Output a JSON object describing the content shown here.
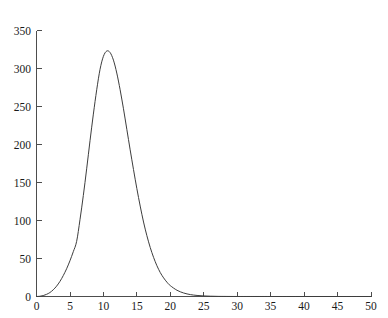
{
  "chart_data": {
    "type": "line",
    "title": "",
    "subtitle": "",
    "xlabel": "",
    "ylabel": "",
    "xlim": [
      0,
      50
    ],
    "ylim": [
      0,
      350
    ],
    "grid": false,
    "legend": null,
    "legend_position": "none",
    "x_ticks": [
      0,
      5,
      10,
      15,
      20,
      25,
      30,
      35,
      40,
      45,
      50
    ],
    "x_tick_labels": [
      "0",
      "5",
      "10",
      "15",
      "20",
      "25",
      "30",
      "35",
      "40",
      "45",
      "50"
    ],
    "y_ticks": [
      0,
      50,
      100,
      150,
      200,
      250,
      300,
      350
    ],
    "y_tick_labels": [
      "0",
      "50",
      "100",
      "150",
      "200",
      "250",
      "300",
      "350"
    ],
    "tick_direction": "in",
    "annotations": [],
    "series": [
      {
        "name": "curve",
        "color": "#3d3d3d",
        "line_width": 1,
        "marker": "none",
        "peak_x": 10.5,
        "peak_y": 323,
        "x": [
          0,
          0.5,
          1,
          1.5,
          2,
          2.5,
          3,
          3.5,
          4,
          4.5,
          5,
          5.5,
          6,
          6.5,
          7,
          7.5,
          8,
          8.5,
          9,
          9.5,
          10,
          10.5,
          11,
          11.5,
          12,
          12.5,
          13,
          13.5,
          14,
          14.5,
          15,
          15.5,
          16,
          16.5,
          17,
          17.5,
          18,
          18.5,
          19,
          19.5,
          20,
          21,
          22,
          23,
          24,
          25,
          26,
          27,
          28,
          30,
          32,
          35,
          40,
          45,
          50
        ],
        "y": [
          0,
          0.3,
          1.2,
          2.8,
          5.2,
          8.8,
          13.6,
          19.8,
          27.5,
          36.5,
          47,
          59,
          72.5,
          101,
          133,
          168,
          205,
          240,
          272,
          299,
          316,
          323,
          321,
          311,
          294,
          272,
          247,
          220,
          193,
          167,
          142,
          119,
          98,
          80,
          64.5,
          51.5,
          40.5,
          31.5,
          24.5,
          18.8,
          14.3,
          8.2,
          4.6,
          2.5,
          1.4,
          0.75,
          0.4,
          0.2,
          0.1,
          0.03,
          0.01,
          0,
          0,
          0,
          0
        ]
      }
    ]
  },
  "colors": {
    "background": "#ffffff",
    "axis": "#4d4d4d",
    "curve": "#3d3d3d",
    "text": "#1a1a1a"
  }
}
